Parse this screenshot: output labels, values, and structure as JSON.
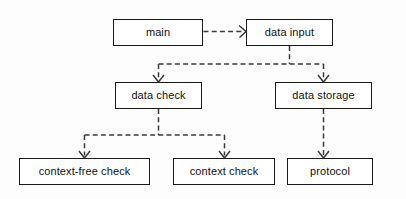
{
  "diagram": {
    "type": "flowchart",
    "orientation": "top-down",
    "background_color": "#fdfdfd",
    "line_color": "#3a3a3a",
    "box_border_color": "#1a1a1a",
    "box_fill_color": "#ffffff",
    "text_color": "#111111",
    "edge_style": "dashed",
    "arrowhead_style": "open-v",
    "nodes": [
      {
        "id": "main",
        "label": "main",
        "x": 113,
        "y": 19,
        "w": 90,
        "h": 27
      },
      {
        "id": "data_input",
        "label": "data input",
        "x": 246,
        "y": 19,
        "w": 87,
        "h": 27
      },
      {
        "id": "data_check",
        "label": "data check",
        "x": 115,
        "y": 82,
        "w": 87,
        "h": 27
      },
      {
        "id": "data_storage",
        "label": "data storage",
        "x": 275,
        "y": 82,
        "w": 97,
        "h": 27
      },
      {
        "id": "context_free_check",
        "label": "context-free check",
        "x": 19,
        "y": 158,
        "w": 131,
        "h": 27
      },
      {
        "id": "context_check",
        "label": "context check",
        "x": 173,
        "y": 158,
        "w": 102,
        "h": 27
      },
      {
        "id": "protocol",
        "label": "protocol",
        "x": 287,
        "y": 158,
        "w": 86,
        "h": 27
      }
    ],
    "edges": [
      {
        "id": "main-to-data-input",
        "from": "main",
        "to": "data_input",
        "route": "horizontal"
      },
      {
        "id": "data-input-to-data-check",
        "from": "data_input",
        "to": "data_check",
        "route": "down-bus-left"
      },
      {
        "id": "data-input-to-data-storage",
        "from": "data_input",
        "to": "data_storage",
        "route": "down-bus-right"
      },
      {
        "id": "data-check-to-context-free-check",
        "from": "data_check",
        "to": "context_free_check",
        "route": "down-bus-left"
      },
      {
        "id": "data-check-to-context-check",
        "from": "data_check",
        "to": "context_check",
        "route": "down-bus-right"
      },
      {
        "id": "data-storage-to-protocol",
        "from": "data_storage",
        "to": "protocol",
        "route": "vertical"
      }
    ]
  }
}
